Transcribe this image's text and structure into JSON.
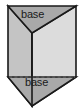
{
  "figure": {
    "name": "triangular-prism",
    "labels": {
      "top_base": "base",
      "bottom_base": "base"
    },
    "colors": {
      "outline": "#1a1a1a",
      "top_face": "#a8a8a8",
      "left_face": "#c4c4c4",
      "right_face": "#dadada",
      "bottom_face": "#a8a8a8",
      "hidden_edge": "#6b6b6b",
      "background": "#ffffff",
      "label_text": "#1a1a1a"
    },
    "geometry": {
      "top_left_vertex": [
        8,
        6
      ],
      "top_right_vertex": [
        76,
        6
      ],
      "top_front_vertex": [
        32,
        33
      ],
      "bottom_left_vertex": [
        8,
        77
      ],
      "bottom_right_vertex": [
        76,
        77
      ],
      "bottom_front_vertex": [
        32,
        106
      ],
      "hidden_edge_y": 77,
      "front_vertical_edge": [
        32,
        33,
        32,
        106
      ]
    },
    "edges": {
      "hidden_edge_style": "dashed",
      "visible_edge_style": "solid"
    }
  }
}
